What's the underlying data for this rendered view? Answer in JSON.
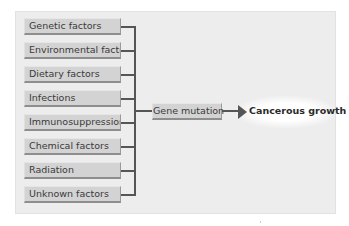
{
  "diagram": {
    "causes": [
      {
        "label": "Genetic factors"
      },
      {
        "label": "Environmental factors"
      },
      {
        "label": "Dietary factors"
      },
      {
        "label": "Infections"
      },
      {
        "label": "Immunosuppression"
      },
      {
        "label": "Chemical factors"
      },
      {
        "label": "Radiation"
      },
      {
        "label": "Unknown factors"
      }
    ],
    "intermediate": {
      "label": "Gene mutation"
    },
    "outcome": {
      "label": "Cancerous growth"
    },
    "colors": {
      "panel": "#ededed",
      "box": "#d3d3d3",
      "connector": "#555555",
      "text": "#3a3a3a"
    }
  }
}
